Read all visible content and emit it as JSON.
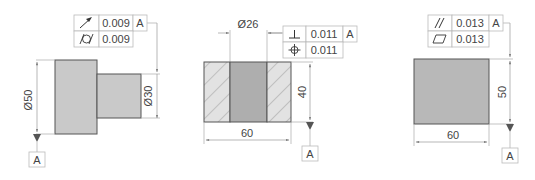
{
  "colors": {
    "part_fill": "#c9c9c9",
    "part_dark_fill": "#aeaeae",
    "hatch_bg": "#e2e2e2",
    "outline": "#555555",
    "dim_line": "#9a9a9a",
    "text": "#444444"
  },
  "figures": [
    {
      "id": "stepped-shaft",
      "dimensions": {
        "large_diameter": "Ø50",
        "small_diameter": "Ø30"
      },
      "fcf": {
        "rows": [
          {
            "symbol": "circular-runout-icon",
            "tolerance": "0.009",
            "datum": "A"
          },
          {
            "symbol": "cylindricity-icon",
            "tolerance": "0.009",
            "datum": ""
          }
        ]
      },
      "datum_label": "A"
    },
    {
      "id": "bushing-section",
      "dimensions": {
        "bore_diameter": "Ø26",
        "width": "60",
        "height": "40"
      },
      "fcf": {
        "rows": [
          {
            "symbol": "perpendicularity-icon",
            "tolerance": "0.011",
            "datum": "A"
          },
          {
            "symbol": "position-icon",
            "tolerance": "0.011",
            "datum": ""
          }
        ]
      },
      "datum_label": "A"
    },
    {
      "id": "rect-block",
      "dimensions": {
        "width": "60",
        "height": "50"
      },
      "fcf": {
        "rows": [
          {
            "symbol": "parallelism-icon",
            "tolerance": "0.013",
            "datum": "A"
          },
          {
            "symbol": "flatness-icon",
            "tolerance": "0.013",
            "datum": ""
          }
        ]
      },
      "datum_label": "A"
    }
  ]
}
